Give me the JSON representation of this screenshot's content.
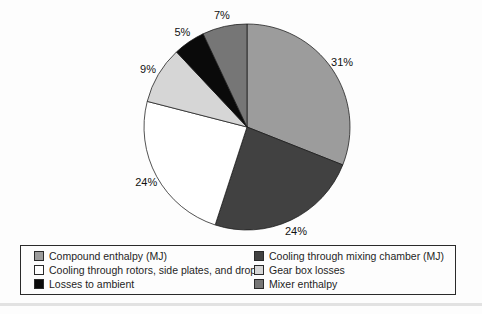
{
  "chart_data": {
    "type": "pie",
    "title": "",
    "direction": "clockwise",
    "start_angle_deg": 0,
    "legend_position": "bottom",
    "outline_color": "#1a1a1a",
    "label_color": "#111111",
    "slices": [
      {
        "label": "Compound enthalpy (MJ)",
        "value": 31,
        "pct_label": "31%",
        "color": "#9c9c9c"
      },
      {
        "label": "Cooling through mixing chamber (MJ)",
        "value": 24,
        "pct_label": "24%",
        "color": "#414141"
      },
      {
        "label": "Cooling through rotors, side plates, and drop door",
        "value": 24,
        "pct_label": "24%",
        "color": "#ffffff"
      },
      {
        "label": "Gear box losses",
        "value": 9,
        "pct_label": "9%",
        "color": "#d6d6d6"
      },
      {
        "label": "Losses to ambient",
        "value": 5,
        "pct_label": "5%",
        "color": "#0a0a0a"
      },
      {
        "label": "Mixer enthalpy",
        "value": 7,
        "pct_label": "7%",
        "color": "#767676"
      }
    ]
  }
}
